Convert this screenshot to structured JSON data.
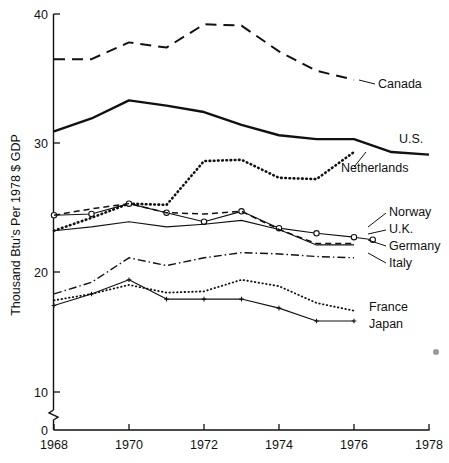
{
  "chart_data": {
    "type": "line",
    "title": "",
    "xlabel": "",
    "ylabel": "Thousand Btu's Per 1978 $ GDP",
    "x": [
      1968,
      1969,
      1970,
      1971,
      1972,
      1973,
      1974,
      1975,
      1976,
      1977,
      1978
    ],
    "xticks": [
      "1968",
      "1970",
      "1972",
      "1974",
      "1976",
      "1978"
    ],
    "xtick_values": [
      1968,
      1970,
      1972,
      1974,
      1976,
      1978
    ],
    "yticks": [
      "0",
      "10",
      "20",
      "30",
      "40"
    ],
    "ytick_values": [
      0,
      10,
      20,
      30,
      40
    ],
    "xlim": [
      1968,
      1978
    ],
    "ylim": [
      0,
      40
    ],
    "axis_break": true,
    "axis_break_note": "y-axis broken between 0 and 10",
    "grid": false,
    "legend_position": "right-inline-labels",
    "series": [
      {
        "name": "Canada",
        "style": "dashed",
        "marker": "none",
        "label": "Canada",
        "values": [
          36.5,
          36.5,
          37.8,
          37.4,
          39.2,
          39.1,
          37.1,
          35.6,
          34.9,
          null,
          null
        ],
        "x": [
          1968,
          1969,
          1970,
          1971,
          1972,
          1973,
          1974,
          1975,
          1976,
          null,
          null
        ]
      },
      {
        "name": "U.S.",
        "style": "solid-thick",
        "marker": "none",
        "label": "U.S.",
        "values": [
          30.9,
          31.9,
          33.3,
          32.9,
          32.4,
          31.4,
          30.6,
          30.3,
          30.3,
          29.3,
          29.1
        ]
      },
      {
        "name": "Netherlands",
        "style": "dotted-thick",
        "marker": "none",
        "label": "Netherlands",
        "values": [
          23.2,
          24.2,
          25.3,
          25.2,
          28.6,
          28.7,
          27.3,
          27.2,
          29.3,
          null,
          null
        ],
        "x": [
          1968,
          1969,
          1970,
          1971,
          1972,
          1973,
          1974,
          1975,
          1976,
          null,
          null
        ]
      },
      {
        "name": "Norway",
        "style": "solid-thin-circles",
        "marker": "open-circle",
        "label": "Norway",
        "values": [
          24.4,
          24.5,
          25.3,
          24.6,
          23.9,
          24.7,
          23.4,
          23.0,
          22.7,
          22.5,
          null
        ],
        "x": [
          1968,
          1969,
          1970,
          1971,
          1972,
          1973,
          1974,
          1975,
          1976,
          1976.5,
          null
        ]
      },
      {
        "name": "U.K.",
        "style": "dashed-thin",
        "marker": "none",
        "label": "U.K.",
        "values": [
          24.4,
          24.9,
          25.3,
          24.6,
          24.5,
          24.7,
          23.3,
          22.2,
          22.2,
          null,
          null
        ],
        "x": [
          1968,
          1969,
          1970,
          1971,
          1972,
          1973,
          1974,
          1975,
          1976,
          null,
          null
        ]
      },
      {
        "name": "Germany",
        "style": "solid-thin",
        "marker": "none",
        "label": "Germany",
        "values": [
          23.2,
          23.5,
          23.9,
          23.5,
          23.7,
          24.0,
          23.3,
          22.1,
          22.1,
          null,
          null
        ],
        "x": [
          1968,
          1969,
          1970,
          1971,
          1972,
          1973,
          1974,
          1975,
          1976,
          null,
          null
        ]
      },
      {
        "name": "Italy",
        "style": "dash-dot",
        "marker": "none",
        "label": "Italy",
        "values": [
          18.3,
          19.2,
          21.1,
          20.5,
          21.1,
          21.5,
          21.4,
          21.2,
          21.1,
          null,
          null
        ],
        "x": [
          1968,
          1969,
          1970,
          1971,
          1972,
          1973,
          1974,
          1975,
          1976,
          null,
          null
        ]
      },
      {
        "name": "France",
        "style": "dotted-thin",
        "marker": "none",
        "label": "France",
        "values": [
          17.8,
          18.3,
          19.0,
          18.4,
          18.5,
          19.4,
          18.9,
          17.6,
          17.0,
          null,
          null
        ],
        "x": [
          1968,
          1969,
          1970,
          1971,
          1972,
          1973,
          1974,
          1975,
          1976,
          null,
          null
        ]
      },
      {
        "name": "Japan",
        "style": "solid-thin-plus",
        "marker": "plus",
        "label": "Japan",
        "values": [
          17.4,
          18.3,
          19.4,
          17.9,
          17.9,
          17.9,
          17.2,
          16.2,
          16.2,
          null,
          null
        ],
        "x": [
          1968,
          1969,
          1970,
          1971,
          1972,
          1973,
          1974,
          1975,
          1976,
          null,
          null
        ]
      }
    ],
    "annotations": [
      {
        "text": "Canada",
        "target_series": "Canada"
      },
      {
        "text": "U.S.",
        "target_series": "U.S."
      },
      {
        "text": "Netherlands",
        "target_series": "Netherlands"
      },
      {
        "text": "Norway",
        "target_series": "Norway"
      },
      {
        "text": "U.K.",
        "target_series": "U.K."
      },
      {
        "text": "Germany",
        "target_series": "Germany"
      },
      {
        "text": "Italy",
        "target_series": "Italy"
      },
      {
        "text": "France",
        "target_series": "France"
      },
      {
        "text": "Japan",
        "target_series": "Japan"
      }
    ]
  },
  "axis": {
    "y_label": "Thousand Btu's Per 1978 $ GDP",
    "y_ticks": [
      "40",
      "30",
      "20",
      "10",
      "0"
    ],
    "x_ticks": [
      "1968",
      "1970",
      "1972",
      "1974",
      "1976",
      "1978"
    ]
  },
  "labels": {
    "canada": "Canada",
    "us": "U.S.",
    "netherlands": "Netherlands",
    "norway": "Norway",
    "uk": "U.K.",
    "germany": "Germany",
    "italy": "Italy",
    "france": "France",
    "japan": "Japan"
  },
  "colors": {
    "ink": "#111111",
    "background": "#ffffff",
    "speck": "#9a9a9a"
  }
}
